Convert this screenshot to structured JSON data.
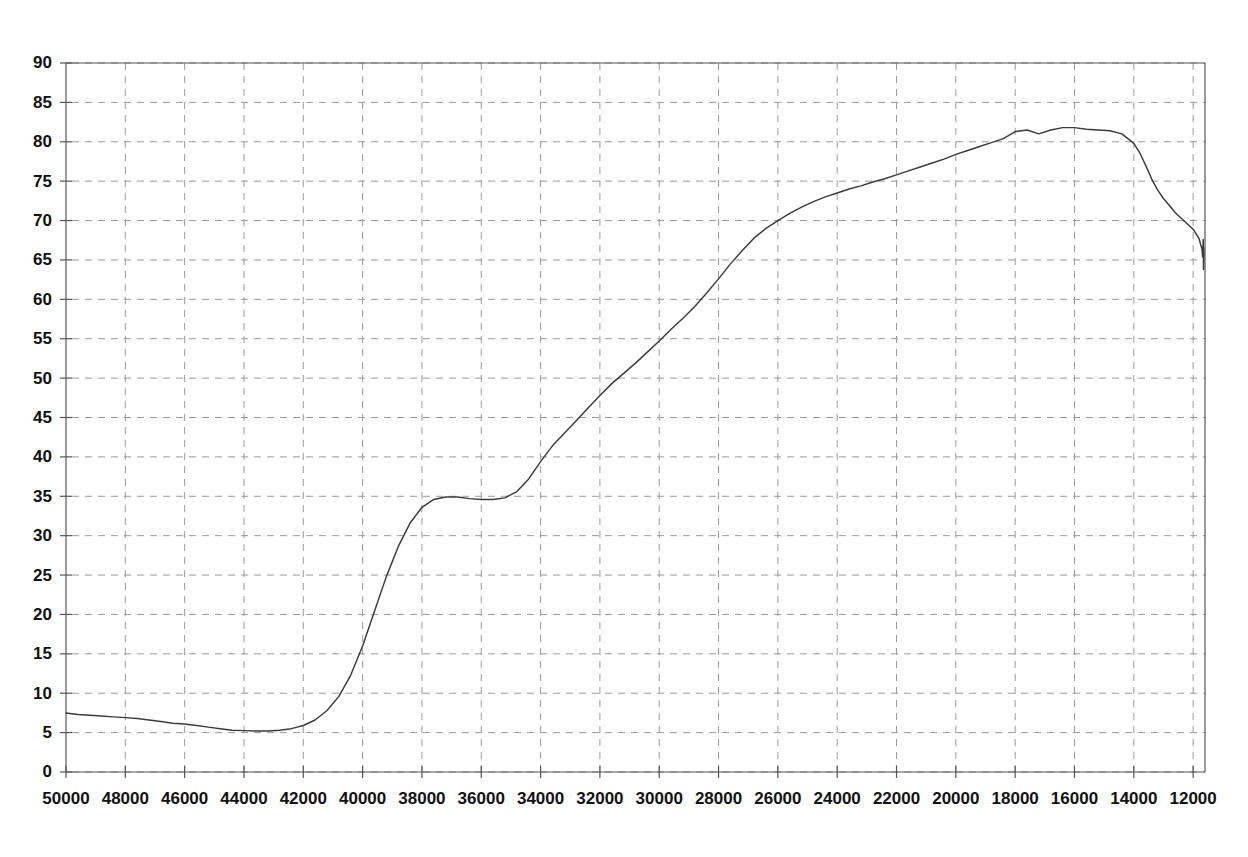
{
  "chart_data": {
    "type": "line",
    "title": "",
    "subtitle": "",
    "xlabel": "",
    "ylabel": "",
    "xlim": [
      50000,
      11600
    ],
    "ylim": [
      0,
      90
    ],
    "x_reversed": true,
    "grid": true,
    "legend": null,
    "legend_position": "none",
    "line_color": "#3b3b3b",
    "background_color": "#ffffff",
    "grid_color": "#9a9a9a",
    "axis_color": "#555555",
    "x_ticks": [
      50000,
      48000,
      46000,
      44000,
      42000,
      40000,
      38000,
      36000,
      34000,
      32000,
      30000,
      28000,
      26000,
      24000,
      22000,
      20000,
      18000,
      16000,
      14000,
      12000
    ],
    "x_tick_labels": [
      "50000",
      "48000",
      "46000",
      "44000",
      "42000",
      "40000",
      "38000",
      "36000",
      "34000",
      "32000",
      "30000",
      "28000",
      "26000",
      "24000",
      "22000",
      "20000",
      "18000",
      "16000",
      "14000",
      "12000"
    ],
    "y_ticks": [
      0,
      5,
      10,
      15,
      20,
      25,
      30,
      35,
      40,
      45,
      50,
      55,
      60,
      65,
      70,
      75,
      80,
      85,
      90
    ],
    "y_tick_labels": [
      "0",
      "5",
      "10",
      "15",
      "20",
      "25",
      "30",
      "35",
      "40",
      "45",
      "50",
      "55",
      "60",
      "65",
      "70",
      "75",
      "80",
      "85",
      "90"
    ],
    "series": [
      {
        "name": "curve",
        "x": [
          50000,
          49600,
          49200,
          48800,
          48400,
          48000,
          47600,
          47200,
          46800,
          46400,
          46000,
          45600,
          45200,
          44800,
          44400,
          44000,
          43600,
          43200,
          42800,
          42400,
          42000,
          41600,
          41200,
          40800,
          40400,
          40000,
          39600,
          39200,
          38800,
          38400,
          38000,
          37600,
          37200,
          36800,
          36400,
          36000,
          35600,
          35200,
          34800,
          34400,
          34000,
          33600,
          33200,
          32800,
          32400,
          32000,
          31600,
          31200,
          30800,
          30400,
          30000,
          29600,
          29200,
          28800,
          28400,
          28000,
          27600,
          27200,
          26800,
          26400,
          26000,
          25600,
          25200,
          24800,
          24400,
          24000,
          23600,
          23200,
          22800,
          22400,
          22000,
          21600,
          21200,
          20800,
          20400,
          20000,
          19600,
          19200,
          18800,
          18400,
          18000,
          17600,
          17200,
          16800,
          16400,
          16000,
          15600,
          15200,
          14800,
          14400,
          14000,
          13800,
          13600,
          13400,
          13200,
          13000,
          12800,
          12600,
          12400,
          12200,
          12000,
          11900,
          11800,
          11750,
          11700,
          11680,
          11660,
          11650,
          11640
        ],
        "y": [
          7.5,
          7.3,
          7.2,
          7.1,
          7.0,
          6.9,
          6.8,
          6.6,
          6.4,
          6.2,
          6.1,
          5.9,
          5.7,
          5.5,
          5.3,
          5.25,
          5.2,
          5.2,
          5.3,
          5.5,
          5.9,
          6.6,
          7.8,
          9.6,
          12.3,
          16.0,
          20.4,
          24.8,
          28.6,
          31.6,
          33.6,
          34.6,
          34.9,
          34.9,
          34.7,
          34.6,
          34.6,
          34.8,
          35.6,
          37.2,
          39.4,
          41.4,
          43.0,
          44.6,
          46.2,
          47.8,
          49.3,
          50.6,
          51.9,
          53.3,
          54.7,
          56.2,
          57.6,
          59.1,
          60.8,
          62.6,
          64.5,
          66.2,
          67.8,
          69.0,
          70.0,
          70.9,
          71.7,
          72.4,
          73.0,
          73.5,
          74.0,
          74.4,
          74.9,
          75.3,
          75.8,
          76.3,
          76.8,
          77.3,
          77.8,
          78.4,
          78.9,
          79.4,
          79.9,
          80.4,
          81.3,
          81.5,
          81.0,
          81.5,
          81.8,
          81.8,
          81.6,
          81.5,
          81.4,
          81.0,
          79.8,
          78.6,
          77.0,
          75.3,
          73.9,
          72.8,
          71.9,
          71.0,
          70.3,
          69.6,
          68.9,
          68.3,
          67.7,
          67.0,
          66.4,
          65.4,
          67.6,
          63.8,
          66.5
        ]
      }
    ],
    "annotations": [
      {
        "text": "minimum",
        "x": 43400,
        "y": 5.2
      },
      {
        "text": "plateau",
        "x": 37000,
        "y": 34.8
      },
      {
        "text": "peak",
        "x": 16800,
        "y": 81.8
      }
    ]
  },
  "geometry": {
    "plot_left": 66,
    "plot_right": 1205,
    "plot_top": 63,
    "plot_bottom": 772
  }
}
